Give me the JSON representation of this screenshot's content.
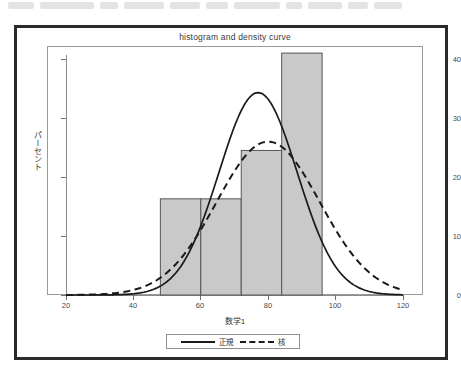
{
  "chart_data": {
    "type": "bar",
    "title": "histogram and density curve",
    "xlabel": "数学1",
    "ylabel": "パーセント",
    "xlim": [
      20,
      120
    ],
    "ylim": [
      0,
      42
    ],
    "xticks": [
      20,
      40,
      60,
      80,
      100,
      120
    ],
    "yticks": [
      0,
      10,
      20,
      30,
      40
    ],
    "grid": false,
    "legend_position": "bottom",
    "histogram": {
      "bin_width": 12,
      "bin_edges": [
        48,
        60,
        72,
        84,
        96
      ],
      "categories": [
        "48-60",
        "60-72",
        "72-84",
        "84-96"
      ],
      "values": [
        16.3,
        16.3,
        24.5,
        41.0
      ],
      "fill_color": "#c9c9c9",
      "edge_color": "#555555"
    },
    "series": [
      {
        "name": "正規",
        "style": "solid",
        "color": "#1a1a1a",
        "distribution": "normal",
        "mean": 77,
        "sigma": 11.6,
        "peak_value": 34.3,
        "peak_x": 77
      },
      {
        "name": "核",
        "style": "dashed",
        "color": "#1a1a1a",
        "distribution": "kernel",
        "mean": 80,
        "sigma": 15.3,
        "peak_value": 26.0,
        "peak_x": 82
      }
    ]
  },
  "chart": {
    "title": "histogram and density curve",
    "x_axis_title": "数学1",
    "y_axis_title": "パーセント",
    "y_tick_labels": [
      "0",
      "10",
      "20",
      "30",
      "40"
    ],
    "x_tick_labels": [
      "20",
      "40",
      "60",
      "80",
      "100",
      "120"
    ],
    "legend": {
      "entries": [
        {
          "label": "正規",
          "style": "solid"
        },
        {
          "label": "核",
          "style": "dashed"
        }
      ]
    }
  }
}
